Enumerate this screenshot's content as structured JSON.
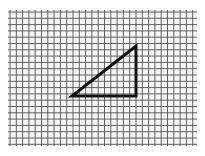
{
  "diagram": {
    "type": "grid-figure",
    "grid": {
      "x0": 8,
      "y0": 10,
      "x1": 197,
      "y1": 146,
      "spacing": 6.3,
      "line_color": "#555555",
      "background": "#f4f4f4"
    },
    "shapes": [
      {
        "kind": "right-triangle",
        "vertices": [
          [
            72,
            96
          ],
          [
            136,
            96
          ],
          [
            136,
            46
          ]
        ],
        "grid_vertices": [
          [
            10,
            14
          ],
          [
            20,
            14
          ],
          [
            20,
            6
          ]
        ],
        "stroke": "#111111",
        "stroke_width": 3
      }
    ],
    "caption": ""
  }
}
